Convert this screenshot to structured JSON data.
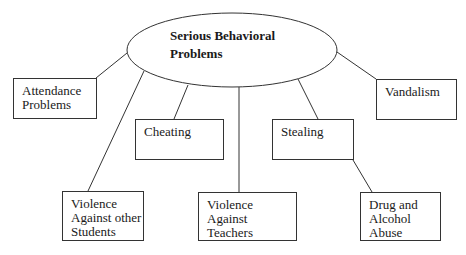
{
  "diagram": {
    "type": "concept-map",
    "root": {
      "label_line1": "Serious Behavioral",
      "label_line2": "Problems"
    },
    "nodes": [
      {
        "id": "attendance",
        "lines": [
          "Attendance",
          "Problems"
        ]
      },
      {
        "id": "vandalism",
        "lines": [
          "Vandalism"
        ]
      },
      {
        "id": "cheating",
        "lines": [
          "Cheating"
        ]
      },
      {
        "id": "stealing",
        "lines": [
          "Stealing"
        ]
      },
      {
        "id": "violence-students",
        "lines": [
          "Violence",
          "Against other",
          "Students"
        ]
      },
      {
        "id": "violence-teachers",
        "lines": [
          "Violence Against",
          "Teachers"
        ]
      },
      {
        "id": "drug-alcohol",
        "lines": [
          "Drug and",
          "Alcohol",
          "Abuse"
        ]
      }
    ],
    "edges": [
      {
        "from": "root",
        "to": "attendance"
      },
      {
        "from": "root",
        "to": "vandalism"
      },
      {
        "from": "root",
        "to": "cheating"
      },
      {
        "from": "root",
        "to": "stealing"
      },
      {
        "from": "root",
        "to": "violence-students"
      },
      {
        "from": "root",
        "to": "violence-teachers"
      },
      {
        "from": "stealing",
        "to": "drug-alcohol"
      }
    ]
  }
}
